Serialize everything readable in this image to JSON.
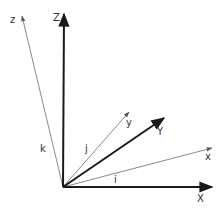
{
  "diagram": {
    "title": "",
    "origin": [
      63,
      187
    ],
    "colors": {
      "world_axis": "#1a1a1a",
      "local_axis": "#8a8a8a",
      "unit_vector_head": "#333333",
      "label": "#333333"
    },
    "world_axes": [
      {
        "name": "X",
        "label": "X",
        "tip": [
          212,
          187
        ],
        "label_pos": [
          197,
          202
        ]
      },
      {
        "name": "Y",
        "label": "Y",
        "tip": [
          164,
          118
        ],
        "label_pos": [
          157,
          135
        ]
      },
      {
        "name": "Z",
        "label": "Z",
        "tip": [
          64,
          14
        ],
        "label_pos": [
          53,
          21
        ]
      }
    ],
    "local_axes": [
      {
        "name": "x",
        "label": "x",
        "tip": [
          212,
          148
        ],
        "label_pos": [
          205,
          160
        ]
      },
      {
        "name": "y",
        "label": "y",
        "tip": [
          129,
          112
        ],
        "label_pos": [
          126,
          126
        ]
      },
      {
        "name": "z",
        "label": "z",
        "tip": [
          22,
          16
        ],
        "label_pos": [
          10,
          23
        ]
      }
    ],
    "unit_vectors": [
      {
        "name": "i",
        "label": "i",
        "tip": [
          104,
          180
        ],
        "label_pos": [
          114,
          183
        ]
      },
      {
        "name": "j",
        "label": "j",
        "tip": [
          95,
          150
        ],
        "label_pos": [
          85,
          152
        ]
      },
      {
        "name": "k",
        "label": "k",
        "tip": [
          53,
          138
        ],
        "label_pos": [
          40,
          152
        ]
      }
    ]
  }
}
